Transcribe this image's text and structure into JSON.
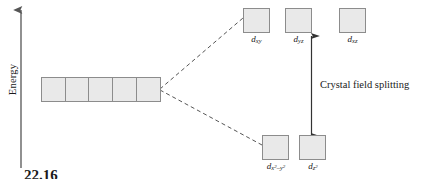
{
  "figure": {
    "type": "crystal-field-splitting-diagram",
    "background_color": "#ffffff",
    "width": 422,
    "height": 179
  },
  "axis": {
    "label": "Energy",
    "icon": "up-arrow-icon",
    "color": "#555555"
  },
  "degenerate_set": {
    "name": "free-ion-d-orbitals",
    "box_count": 5,
    "fill_color": "#e9e9e9",
    "border_color": "#8c8c8c"
  },
  "upper_levels": {
    "name": "t2g-set",
    "orbitals": [
      {
        "letter": "d",
        "sub": "xy",
        "label": "dxy"
      },
      {
        "letter": "d",
        "sub": "yz",
        "label": "dyz"
      },
      {
        "letter": "d",
        "sub": "xz",
        "label": "dxz"
      }
    ]
  },
  "lower_levels": {
    "name": "eg-set",
    "orbitals": [
      {
        "letter": "d",
        "sub_base": "x",
        "sub_sup1": "2",
        "sub_mid": "–y",
        "sub_sup2": "2",
        "label": "dx2-y2"
      },
      {
        "letter": "d",
        "sub_base": "z",
        "sub_sup1": "2",
        "sub_mid": "",
        "sub_sup2": "",
        "label": "dz2"
      }
    ]
  },
  "splitting_arrow": {
    "label": "Crystal field splitting",
    "icon": "double-headed-vertical-arrow-icon",
    "color": "#333333"
  },
  "connectors": {
    "style": "dashed",
    "color": "#555555"
  },
  "figure_number": {
    "text": "22.16"
  }
}
